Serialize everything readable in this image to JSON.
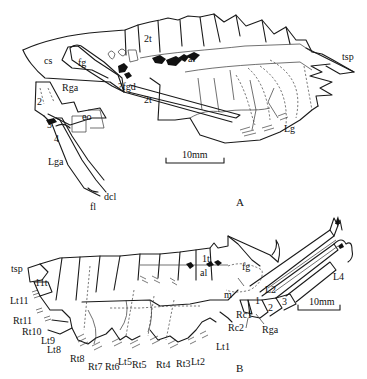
{
  "figure": {
    "panels": [
      {
        "id": "A",
        "label": "A",
        "scale_bar": "10mm",
        "labels": {
          "cs": "cs",
          "fg": "fg",
          "t2_upper": "2t",
          "al": "al",
          "tsp": "tsp",
          "fgd": "?fgd",
          "t2_lower": "2t",
          "rga": "Rga",
          "seg2": "2",
          "seg3": "3",
          "seg4": "4",
          "eo": "eo",
          "lg": "Lg",
          "lga": "Lga",
          "dcl": "dcl",
          "fl": "fl"
        }
      },
      {
        "id": "B",
        "label": "B",
        "scale_bar": "10mm",
        "labels": {
          "tsp": "tsp",
          "t11": "11t",
          "lt11": "Lt11",
          "rt11": "Rt11",
          "rt10": "Rt10",
          "lt9": "Lt9",
          "lt8": "Lt8",
          "rt8": "Rt8",
          "rt7": "Rt7",
          "rt6": "Rt6",
          "lt5": "Lt5",
          "rt5": "Rt5",
          "rt4": "Rt4",
          "rt3": "Rt3",
          "lt2": "Lt2",
          "lt1": "Lt1",
          "rc2": "Rc2",
          "rc1": "Rc1",
          "m": "m",
          "al": "al",
          "t1": "1t",
          "fg": "fg",
          "l2": "L2",
          "seg1": "1",
          "seg2": "2",
          "seg3": "3",
          "rga": "Rga",
          "l4": "L4"
        }
      }
    ]
  }
}
